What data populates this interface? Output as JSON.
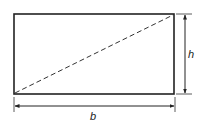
{
  "diagram": {
    "shape": "rectangle",
    "diagonal_style": "dashed",
    "labels": {
      "height": "h",
      "base": "b"
    },
    "colors": {
      "stroke": "#222222",
      "background": "#ffffff"
    }
  }
}
